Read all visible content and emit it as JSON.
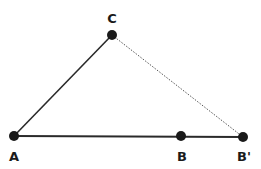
{
  "diagram": {
    "points": [
      {
        "id": "A",
        "label": "A",
        "x": 14,
        "y": 136,
        "label_x": 14,
        "label_y": 161
      },
      {
        "id": "B",
        "label": "B",
        "x": 181,
        "y": 136,
        "label_x": 182,
        "label_y": 161
      },
      {
        "id": "B_prime",
        "label": "B'",
        "x": 243,
        "y": 137,
        "label_x": 242,
        "label_y": 161
      },
      {
        "id": "C",
        "label": "C",
        "x": 112,
        "y": 35,
        "label_x": 112,
        "label_y": 24
      }
    ],
    "segments": [
      {
        "from": "A",
        "to": "C",
        "style": "solid"
      },
      {
        "from": "A",
        "to": "B_prime",
        "style": "solid"
      },
      {
        "from": "C",
        "to": "B_prime",
        "style": "dotted"
      }
    ],
    "colors": {
      "line": "#2a2a2a",
      "point": "#1a1a1a",
      "dotted": "#555555"
    }
  }
}
